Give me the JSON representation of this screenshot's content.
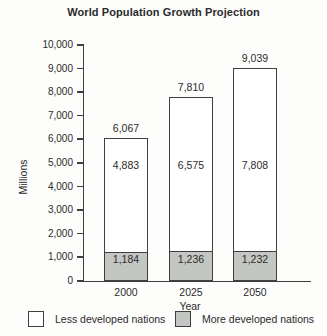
{
  "figure": {
    "title": "World Population Growth Projection"
  },
  "y_axis": {
    "label": "Millions",
    "ticks": [
      "0",
      "1,000",
      "2,000",
      "3,000",
      "4,000",
      "5,000",
      "6,000",
      "7,000",
      "8,000",
      "9,000",
      "10,000"
    ],
    "max": 10000,
    "step": 1000
  },
  "x_axis": {
    "label": "Year",
    "categories": [
      "2000",
      "2025",
      "2050"
    ]
  },
  "chart_data": {
    "type": "bar",
    "stacked": true,
    "title": "World Population Growth Projection",
    "xlabel": "Year",
    "ylabel": "Millions",
    "ylim": [
      0,
      10000
    ],
    "ytick_step": 1000,
    "grid": false,
    "legend_position": "bottom",
    "categories": [
      "2000",
      "2025",
      "2050"
    ],
    "series": [
      {
        "name": "More developed nations",
        "color": "#c3c6c2",
        "values": [
          1184,
          1236,
          1232
        ],
        "value_labels": [
          "1,184",
          "1,236",
          "1,232"
        ]
      },
      {
        "name": "Less developed nations",
        "color": "#ffffff",
        "values": [
          4883,
          6575,
          7808
        ],
        "value_labels": [
          "4,883",
          "6,575",
          "7,808"
        ]
      }
    ],
    "totals": [
      6067,
      7810,
      9039
    ],
    "total_labels": [
      "6,067",
      "7,810",
      "9,039"
    ]
  },
  "legend": {
    "items": [
      {
        "label": "Less developed nations",
        "color": "#ffffff"
      },
      {
        "label": "More developed nations",
        "color": "#c3c6c2"
      }
    ]
  },
  "colors": {
    "line": "#3f3f3f",
    "text": "#2b2b2b",
    "background": "#fdfdfc",
    "gray_fill": "#c3c6c2"
  }
}
